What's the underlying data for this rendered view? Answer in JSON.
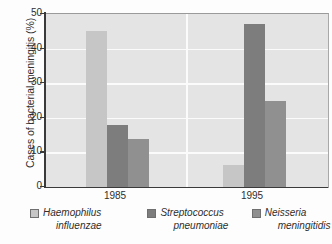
{
  "chart_data": {
    "type": "bar",
    "title": "",
    "subtitle": "",
    "xlabel": "",
    "ylabel": "Cases of bacterial meningitis (%)",
    "categories": [
      "1985",
      "1995"
    ],
    "series": [
      {
        "name": "Haemophilus influenzae",
        "values": [
          45,
          6.5
        ],
        "color": "#c6c6c6"
      },
      {
        "name": "Streptococcus pneumoniae",
        "values": [
          18,
          47
        ],
        "color": "#7d7d7d"
      },
      {
        "name": "Neisseria meningitidis",
        "values": [
          14,
          25
        ],
        "color": "#909090"
      }
    ],
    "ylim": [
      0,
      50
    ],
    "yticks": [
      0,
      10,
      20,
      30,
      40,
      50
    ],
    "ytick_labels": [
      "0",
      "10",
      "20",
      "30",
      "40",
      "50"
    ],
    "grid": "horizontal-and-group-separator",
    "grid_color": "#fbfbfb",
    "plot_background": "#e4e4e4",
    "legend_position": "bottom",
    "legend": [
      {
        "line1": "Haemophilus",
        "line2": "influenzae",
        "swatch": "#c6c6c6"
      },
      {
        "line1": "Streptococcus",
        "line2": "pneumoniae",
        "swatch": "#7d7d7d"
      },
      {
        "line1": "Neisseria",
        "line2": "meningitidis",
        "swatch": "#909090"
      }
    ]
  },
  "axis": {
    "y_title": "Cases of bacterial meningitis (%)",
    "y_labels": {
      "t0": "0",
      "t10": "10",
      "t20": "20",
      "t30": "30",
      "t40": "40",
      "t50": "50"
    },
    "x_labels": {
      "g0": "1985",
      "g1": "1995"
    }
  },
  "legend": {
    "items": [
      {
        "line1": "Haemophilus",
        "line2": "influenzae"
      },
      {
        "line1": "Streptococcus",
        "line2": "pneumoniae"
      },
      {
        "line1": "Neisseria",
        "line2": "meningitidis"
      }
    ]
  },
  "colors": {
    "haemophilus": "#c6c6c6",
    "streptococcus": "#7d7d7d",
    "neisseria": "#909090",
    "plot_bg": "#e4e4e4",
    "gridline": "#fbfbfb",
    "axis": "#3a3a3a"
  }
}
